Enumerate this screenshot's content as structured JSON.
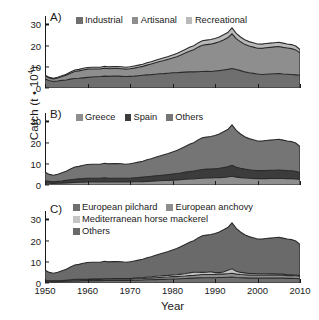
{
  "figure": {
    "ylabel_text": "Catch (t • 10",
    "ylabel_exp": "4",
    "ylabel_close": ")",
    "xlabel": "Year"
  },
  "axes": {
    "yticks": [
      "0",
      "10",
      "20",
      "30"
    ],
    "ytick_values": [
      0,
      10,
      20,
      30
    ],
    "ylim": [
      0,
      34
    ],
    "xticks": [
      "1950",
      "1960",
      "1970",
      "1980",
      "1990",
      "2000",
      "2010"
    ],
    "xtick_values": [
      1950,
      1960,
      1970,
      1980,
      1990,
      2000,
      2010
    ],
    "xlim": [
      1950,
      2010
    ]
  },
  "colors": {
    "dark": "#6f6f6f",
    "mid": "#8e8e8e",
    "light": "#b9b9b9",
    "verydark": "#3c3c3c",
    "outline": "#2b2b2b",
    "axis": "#1a1a1a"
  },
  "panels": [
    {
      "id": "A",
      "label": "A)",
      "legend_rows": [
        [
          {
            "label": "Industrial",
            "color": "#6f6f6f"
          },
          {
            "label": "Artisanal",
            "color": "#8e8e8e"
          },
          {
            "label": "Recreational",
            "color": "#b9b9b9"
          }
        ]
      ]
    },
    {
      "id": "B",
      "label": "B)",
      "legend_rows": [
        [
          {
            "label": "Greece",
            "color": "#8e8e8e"
          },
          {
            "label": "Spain",
            "color": "#3c3c3c"
          },
          {
            "label": "Others",
            "color": "#757575"
          }
        ]
      ]
    },
    {
      "id": "C",
      "label": "C)",
      "legend_rows": [
        [
          {
            "label": "European pilchard",
            "color": "#6f6f6f"
          },
          {
            "label": "European anchovy",
            "color": "#8e8e8e"
          }
        ],
        [
          {
            "label": "Mediterranean horse mackerel",
            "color": "#c4c4c4"
          }
        ],
        [
          {
            "label": "Others",
            "color": "#6a6a6a"
          }
        ]
      ]
    }
  ],
  "chart_data": {
    "type": "area",
    "title": "",
    "xlabel": "Year",
    "ylabel": "Catch (t • 10^4)",
    "xlim": [
      1950,
      2010
    ],
    "ylim": [
      0,
      34
    ],
    "grid": false,
    "stacked": true,
    "x": [
      1950,
      1951,
      1952,
      1953,
      1954,
      1955,
      1956,
      1957,
      1958,
      1959,
      1960,
      1961,
      1962,
      1963,
      1964,
      1965,
      1966,
      1967,
      1968,
      1969,
      1970,
      1971,
      1972,
      1973,
      1974,
      1975,
      1976,
      1977,
      1978,
      1979,
      1980,
      1981,
      1982,
      1983,
      1984,
      1985,
      1986,
      1987,
      1988,
      1989,
      1990,
      1991,
      1992,
      1993,
      1994,
      1995,
      1996,
      1997,
      1998,
      1999,
      2000,
      2001,
      2002,
      2003,
      2004,
      2005,
      2006,
      2007,
      2008,
      2009,
      2010
    ],
    "panels": [
      {
        "id": "A",
        "legend_position": "top-inside",
        "series": [
          {
            "name": "Industrial",
            "color": "#6f6f6f",
            "values": [
              4.3,
              3.4,
              3.1,
              3.3,
              3.6,
              3.8,
              4.2,
              4.5,
              4.6,
              4.8,
              5.0,
              5.2,
              5.3,
              5.4,
              5.6,
              5.5,
              5.7,
              5.6,
              5.5,
              5.4,
              5.5,
              5.6,
              5.8,
              6.0,
              6.2,
              6.3,
              6.5,
              6.7,
              6.8,
              7.0,
              7.2,
              7.2,
              7.4,
              7.5,
              7.6,
              7.6,
              7.7,
              7.8,
              7.9,
              7.8,
              8.0,
              8.2,
              8.5,
              8.8,
              9.2,
              8.7,
              8.2,
              7.6,
              7.2,
              6.9,
              6.6,
              6.4,
              6.5,
              6.6,
              6.7,
              6.8,
              6.6,
              6.5,
              6.4,
              6.2,
              6.0
            ]
          },
          {
            "name": "Artisanal",
            "color": "#8e8e8e",
            "values": [
              1.5,
              1.3,
              1.2,
              1.4,
              1.8,
              2.2,
              2.8,
              3.3,
              3.5,
              3.7,
              3.9,
              3.8,
              3.7,
              3.6,
              3.8,
              3.6,
              3.5,
              3.6,
              3.6,
              3.5,
              3.6,
              3.8,
              4.0,
              4.2,
              4.6,
              5.0,
              5.4,
              5.8,
              6.2,
              6.6,
              7.0,
              7.6,
              8.2,
              9.0,
              9.8,
              10.5,
              11.6,
              12.4,
              12.6,
              12.9,
              13.2,
              13.6,
              14.2,
              14.9,
              16.4,
              14.6,
              13.6,
              13.0,
              12.6,
              12.4,
              12.2,
              12.3,
              12.5,
              12.6,
              12.7,
              12.8,
              12.6,
              12.4,
              12.2,
              11.8,
              10.6
            ]
          },
          {
            "name": "Recreational",
            "color": "#b9b9b9",
            "values": [
              0.3,
              0.3,
              0.3,
              0.4,
              0.4,
              0.5,
              0.6,
              0.7,
              0.7,
              0.8,
              0.8,
              0.8,
              0.8,
              0.8,
              0.9,
              0.9,
              0.9,
              0.9,
              0.9,
              0.9,
              0.9,
              1.0,
              1.0,
              1.0,
              1.1,
              1.1,
              1.2,
              1.2,
              1.3,
              1.3,
              1.4,
              1.5,
              1.6,
              1.7,
              1.8,
              1.9,
              2.0,
              2.1,
              2.1,
              2.2,
              2.2,
              2.3,
              2.4,
              2.5,
              2.8,
              2.5,
              2.3,
              2.2,
              2.1,
              2.1,
              2.0,
              2.0,
              2.0,
              2.0,
              2.0,
              2.0,
              2.0,
              1.9,
              1.9,
              1.8,
              1.6
            ]
          }
        ],
        "total_values": [
          6.1,
          5.0,
          4.6,
          5.1,
          5.8,
          6.5,
          7.6,
          8.5,
          8.8,
          9.3,
          9.7,
          9.8,
          9.8,
          9.8,
          10.3,
          10.0,
          10.1,
          10.1,
          10.0,
          9.8,
          10.0,
          10.4,
          10.8,
          11.2,
          11.9,
          12.4,
          13.1,
          13.7,
          14.3,
          14.9,
          15.6,
          16.3,
          17.2,
          18.2,
          19.2,
          20.0,
          21.3,
          22.3,
          22.6,
          22.9,
          23.4,
          24.1,
          25.1,
          26.2,
          28.4,
          25.8,
          24.1,
          22.8,
          21.9,
          21.4,
          20.8,
          20.7,
          21.0,
          21.2,
          21.4,
          21.6,
          21.2,
          20.8,
          20.5,
          19.8,
          18.2
        ]
      },
      {
        "id": "B",
        "legend_position": "top-inside",
        "series": [
          {
            "name": "Greece",
            "color": "#8e8e8e",
            "values": [
              0.9,
              0.8,
              0.7,
              0.8,
              0.9,
              1.0,
              1.1,
              1.2,
              1.3,
              1.3,
              1.4,
              1.4,
              1.4,
              1.4,
              1.5,
              1.4,
              1.4,
              1.4,
              1.4,
              1.4,
              1.4,
              1.5,
              1.5,
              1.6,
              1.7,
              1.8,
              1.9,
              2.0,
              2.1,
              2.2,
              2.3,
              2.4,
              2.5,
              2.7,
              2.8,
              2.9,
              3.1,
              3.2,
              3.3,
              3.3,
              3.4,
              3.5,
              3.6,
              3.8,
              4.1,
              3.7,
              3.5,
              3.3,
              3.2,
              3.1,
              3.0,
              3.0,
              3.0,
              3.1,
              3.1,
              3.1,
              3.1,
              3.0,
              3.0,
              2.9,
              2.6
            ]
          },
          {
            "name": "Spain",
            "color": "#3c3c3c",
            "values": [
              1.1,
              0.9,
              0.8,
              0.9,
              1.0,
              1.2,
              1.4,
              1.5,
              1.6,
              1.7,
              1.8,
              1.8,
              1.8,
              1.8,
              1.9,
              1.8,
              1.8,
              1.8,
              1.8,
              1.8,
              1.8,
              1.9,
              2.0,
              2.1,
              2.2,
              2.3,
              2.4,
              2.5,
              2.6,
              2.7,
              2.9,
              3.0,
              3.2,
              3.4,
              3.5,
              3.7,
              3.9,
              4.1,
              4.2,
              4.2,
              4.3,
              4.4,
              4.6,
              4.8,
              5.2,
              4.7,
              4.4,
              4.2,
              4.0,
              3.9,
              3.8,
              3.8,
              3.8,
              3.9,
              3.9,
              4.0,
              3.9,
              3.8,
              3.7,
              3.6,
              3.3
            ]
          },
          {
            "name": "Others",
            "color": "#757575",
            "values": [
              4.1,
              3.3,
              3.1,
              3.4,
              3.9,
              4.3,
              5.1,
              5.8,
              5.9,
              6.3,
              6.5,
              6.6,
              6.6,
              6.6,
              6.9,
              6.8,
              6.9,
              6.9,
              6.8,
              6.6,
              6.8,
              7.0,
              7.3,
              7.5,
              8.0,
              8.3,
              8.8,
              9.2,
              9.6,
              10.0,
              10.4,
              10.9,
              11.5,
              12.1,
              12.9,
              13.4,
              14.3,
              15.0,
              15.1,
              15.4,
              15.7,
              16.2,
              16.9,
              17.6,
              19.1,
              17.4,
              16.2,
              15.3,
              14.7,
              14.4,
              14.0,
              13.9,
              14.2,
              14.2,
              14.4,
              14.5,
              14.2,
              14.0,
              13.8,
              13.3,
              12.3
            ]
          }
        ],
        "total_values": [
          6.1,
          5.0,
          4.6,
          5.1,
          5.8,
          6.5,
          7.6,
          8.5,
          8.8,
          9.3,
          9.7,
          9.8,
          9.8,
          9.8,
          10.3,
          10.0,
          10.1,
          10.1,
          10.0,
          9.8,
          10.0,
          10.4,
          10.8,
          11.2,
          11.9,
          12.4,
          13.1,
          13.7,
          14.3,
          14.9,
          15.6,
          16.3,
          17.2,
          18.2,
          19.2,
          20.0,
          21.3,
          22.3,
          22.6,
          22.9,
          23.4,
          24.1,
          25.1,
          26.2,
          28.4,
          25.8,
          24.1,
          22.8,
          21.9,
          21.4,
          20.8,
          20.7,
          21.0,
          21.2,
          21.4,
          21.6,
          21.2,
          20.8,
          20.5,
          19.8,
          18.2
        ]
      },
      {
        "id": "C",
        "legend_position": "top-inside",
        "series": [
          {
            "name": "European pilchard",
            "color": "#6f6f6f",
            "values": [
              0.7,
              0.6,
              0.6,
              0.6,
              0.7,
              0.8,
              0.9,
              1.0,
              1.0,
              1.1,
              1.1,
              1.1,
              1.1,
              1.1,
              1.2,
              1.2,
              1.2,
              1.2,
              1.2,
              1.2,
              1.2,
              1.3,
              1.3,
              1.4,
              1.5,
              1.5,
              1.6,
              1.7,
              1.7,
              1.8,
              1.9,
              1.9,
              2.0,
              2.1,
              2.2,
              2.3,
              2.4,
              2.5,
              2.5,
              2.5,
              2.5,
              2.6,
              2.6,
              2.7,
              2.8,
              2.6,
              2.5,
              2.4,
              2.3,
              2.3,
              2.3,
              2.3,
              2.3,
              2.3,
              2.3,
              2.3,
              2.3,
              2.2,
              2.2,
              2.1,
              2.0
            ]
          },
          {
            "name": "European anchovy",
            "color": "#8e8e8e",
            "values": [
              0.3,
              0.3,
              0.3,
              0.3,
              0.3,
              0.4,
              0.4,
              0.5,
              0.5,
              0.5,
              0.5,
              0.6,
              0.6,
              0.6,
              0.6,
              0.6,
              0.6,
              0.6,
              0.6,
              0.6,
              0.6,
              0.7,
              0.7,
              0.7,
              0.8,
              0.8,
              0.9,
              0.9,
              1.0,
              1.0,
              1.1,
              1.1,
              1.2,
              1.2,
              1.3,
              1.3,
              1.4,
              1.5,
              1.5,
              1.5,
              1.5,
              1.6,
              1.6,
              1.7,
              1.8,
              1.6,
              1.5,
              1.5,
              1.4,
              1.4,
              1.4,
              1.4,
              1.4,
              1.4,
              1.4,
              1.4,
              1.4,
              1.3,
              1.3,
              1.3,
              1.2
            ]
          },
          {
            "name": "Mediterranean horse mackerel",
            "color": "#c4c4c4",
            "values": [
              0.1,
              0.1,
              0.1,
              0.1,
              0.1,
              0.1,
              0.2,
              0.2,
              0.2,
              0.2,
              0.2,
              0.2,
              0.2,
              0.2,
              0.2,
              0.2,
              0.3,
              0.3,
              0.3,
              0.3,
              0.3,
              0.3,
              0.4,
              0.4,
              0.5,
              0.6,
              0.7,
              0.7,
              0.8,
              0.8,
              0.8,
              0.9,
              1.0,
              1.1,
              1.3,
              1.5,
              1.3,
              1.0,
              1.1,
              1.3,
              0.9,
              0.7,
              1.0,
              1.6,
              2.1,
              1.3,
              1.0,
              0.9,
              0.8,
              0.8,
              0.7,
              0.7,
              0.7,
              0.6,
              0.6,
              0.5,
              0.5,
              0.4,
              0.4,
              0.4,
              0.3
            ]
          },
          {
            "name": "Others",
            "color": "#6a6a6a",
            "values": [
              5.0,
              4.0,
              3.6,
              4.1,
              4.7,
              5.2,
              6.1,
              6.8,
              7.1,
              7.5,
              7.9,
              7.9,
              7.9,
              7.9,
              8.3,
              8.0,
              8.0,
              8.0,
              7.9,
              7.7,
              7.9,
              8.1,
              8.4,
              8.7,
              9.1,
              9.5,
              9.9,
              10.4,
              10.8,
              11.3,
              11.8,
              12.4,
              13.0,
              13.8,
              14.4,
              14.9,
              16.2,
              17.3,
              17.5,
              17.6,
              18.5,
              19.2,
              19.9,
              20.2,
              21.7,
              20.3,
              19.1,
              18.0,
              17.4,
              16.9,
              16.4,
              16.3,
              16.6,
              16.9,
              17.1,
              17.4,
              17.0,
              16.9,
              16.6,
              16.0,
              14.7
            ]
          }
        ],
        "total_values": [
          6.1,
          5.0,
          4.6,
          5.1,
          5.8,
          6.5,
          7.6,
          8.5,
          8.8,
          9.3,
          9.7,
          9.8,
          9.8,
          9.8,
          10.3,
          10.0,
          10.1,
          10.1,
          10.0,
          9.8,
          10.0,
          10.4,
          10.8,
          11.2,
          11.9,
          12.4,
          13.1,
          13.7,
          14.3,
          14.9,
          15.6,
          16.3,
          17.2,
          18.2,
          19.2,
          20.0,
          21.3,
          22.3,
          22.6,
          22.9,
          23.4,
          24.1,
          25.1,
          26.2,
          28.4,
          25.8,
          24.1,
          22.8,
          21.9,
          21.4,
          20.8,
          20.7,
          21.0,
          21.2,
          21.4,
          21.6,
          21.2,
          20.8,
          20.5,
          19.8,
          18.2
        ]
      }
    ]
  }
}
